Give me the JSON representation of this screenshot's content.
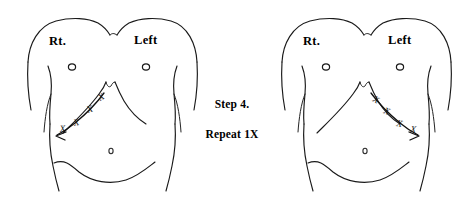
{
  "page": {
    "background_color": "#ffffff",
    "ink_color": "#1a1a1a",
    "width": 464,
    "height": 207
  },
  "instruction": {
    "step_label": "Step 4.",
    "repeat_label": "Repeat 1X"
  },
  "figures": [
    {
      "id": "left-figure",
      "name": "torso-diagram-left",
      "side_labels": {
        "right_label": "Rt.",
        "left_label": "Left"
      },
      "stroke_direction": "right-costal-margin-outward",
      "arrow_direction": "left",
      "x_marks": [
        "X",
        "X",
        "X",
        "X"
      ],
      "x_mark_count": 4
    },
    {
      "id": "right-figure",
      "name": "torso-diagram-right",
      "side_labels": {
        "right_label": "Rt.",
        "left_label": "Left"
      },
      "stroke_direction": "left-costal-margin-outward",
      "arrow_direction": "right",
      "x_marks": [
        "X",
        "X",
        "X",
        "X"
      ],
      "x_mark_count": 4
    }
  ]
}
